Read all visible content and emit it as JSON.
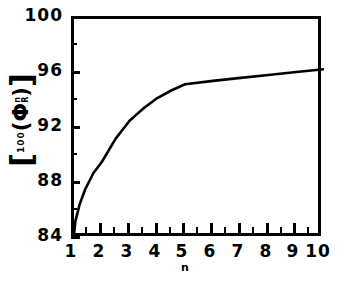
{
  "chart_data": {
    "type": "line",
    "title": "",
    "subtitle": "",
    "xlabel": "n",
    "ylabel": "[ 100 ( Φ R n ) ]",
    "ylabel_parts": {
      "open_bracket": "[",
      "hundred": "100",
      "open_paren": "(",
      "phi": "Φ",
      "subscript": "R",
      "superscript": "n",
      "close_paren": ")",
      "close_bracket": "]"
    },
    "xlim": [
      1,
      10
    ],
    "ylim": [
      84,
      100
    ],
    "grid": false,
    "legend": null,
    "xticks": [
      1,
      2,
      3,
      4,
      5,
      6,
      7,
      8,
      9,
      10
    ],
    "xticklabels": [
      "1",
      "2",
      "3",
      "4",
      "5",
      "6",
      "7",
      "8",
      "9",
      "10"
    ],
    "xminorticks": [
      1.5,
      2.5,
      3.5,
      4.5,
      5.5,
      6.5,
      7.5,
      8.5,
      9.5
    ],
    "yticks": [
      84,
      88,
      92,
      96,
      100
    ],
    "yticklabels": [
      "84",
      "88",
      "92",
      "96",
      "100"
    ],
    "yminorticks": [
      86,
      90,
      94,
      98
    ],
    "series": [
      {
        "name": "curve",
        "color": "#000000",
        "linewidth": 2.6,
        "x": [
          1.0,
          1.05,
          1.2,
          1.4,
          1.7,
          2.0,
          2.5,
          3.0,
          3.5,
          4.0,
          4.5,
          5.0,
          6.0,
          7.0,
          8.0,
          9.0,
          10.0
        ],
        "y": [
          84.35,
          85.3,
          86.5,
          87.6,
          88.8,
          89.6,
          91.3,
          92.6,
          93.5,
          94.25,
          94.8,
          95.25,
          95.5,
          95.72,
          95.93,
          96.15,
          96.35
        ]
      }
    ]
  },
  "axes": {
    "x_title": "n",
    "y_title_display": "[100(ΦRⁿ)]"
  }
}
